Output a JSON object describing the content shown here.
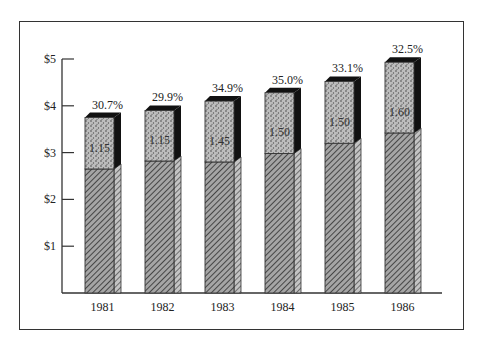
{
  "chart_data": {
    "type": "bar",
    "stacked": true,
    "style": "3d-stacked-bar",
    "title": "",
    "xlabel": "",
    "ylabel": "",
    "ylim": [
      0,
      5
    ],
    "yticks": [
      "$1",
      "$2",
      "$3",
      "$4",
      "$5"
    ],
    "ytick_values": [
      1,
      2,
      3,
      4,
      5
    ],
    "grid": false,
    "legend": null,
    "categories": [
      "1981",
      "1982",
      "1983",
      "1984",
      "1985",
      "1986"
    ],
    "series": [
      {
        "name": "lower segment (hatched)",
        "pattern": "diagonal-hatch",
        "values": [
          2.65,
          2.82,
          2.8,
          2.98,
          3.2,
          3.42
        ]
      },
      {
        "name": "upper segment (stippled)",
        "pattern": "dotted",
        "values": [
          1.1,
          1.08,
          1.3,
          1.3,
          1.32,
          1.51
        ],
        "data_labels": [
          "1.15",
          "1.15",
          "1.45",
          "1.50",
          "1.50",
          "1.60"
        ]
      }
    ],
    "totals": [
      3.75,
      3.9,
      4.1,
      4.28,
      4.52,
      4.93
    ],
    "annotations": [
      "30.7%",
      "29.9%",
      "34.9%",
      "35.0%",
      "33.1%",
      "32.5%"
    ],
    "colors": {
      "hatch_fill": "#9a9a9a",
      "hatch_line": "#333333",
      "stipple_fill": "#b8b8b8",
      "stipple_dot": "#3a3a3a",
      "shadow": "#111111",
      "axis": "#333333"
    }
  }
}
